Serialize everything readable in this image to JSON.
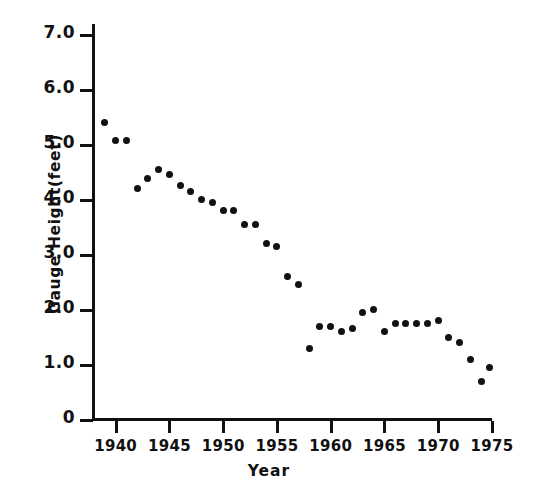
{
  "chart_data": {
    "type": "scatter",
    "title": "",
    "xlabel": "Year",
    "ylabel": "Gauge Height(feet)",
    "xlim": [
      1937.8,
      1975.0
    ],
    "ylim": [
      0,
      7.0
    ],
    "xticks": [
      1940,
      1945,
      1950,
      1955,
      1960,
      1965,
      1970,
      1975
    ],
    "xtick_labels": [
      "1940",
      "1945",
      "1950",
      "1955",
      "1960",
      "1965",
      "1970",
      "1975"
    ],
    "yticks": [
      0,
      1.0,
      2.0,
      3.0,
      4.0,
      5.0,
      6.0,
      7.0
    ],
    "ytick_labels": [
      "0",
      "1.0",
      "2.0",
      "3.0",
      "4.0",
      "5.0",
      "6.0",
      "7.0"
    ],
    "grid": false,
    "legend": false,
    "marker": "filled-circle",
    "marker_color": "#111111",
    "x": [
      1939,
      1940,
      1941,
      1942,
      1943,
      1944,
      1945,
      1946,
      1947,
      1948,
      1949,
      1950,
      1951,
      1952,
      1953,
      1954,
      1955,
      1956,
      1957,
      1958,
      1959,
      1960,
      1961,
      1962,
      1963,
      1964,
      1965,
      1966,
      1967,
      1968,
      1969,
      1970,
      1971,
      1972,
      1973,
      1974
    ],
    "values": [
      5.4,
      5.1,
      5.1,
      4.2,
      4.4,
      4.55,
      4.45,
      4.25,
      4.15,
      4.0,
      3.95,
      3.8,
      3.8,
      3.55,
      3.55,
      3.2,
      3.15,
      2.6,
      2.45,
      1.3,
      1.7,
      1.7,
      1.6,
      1.65,
      1.95,
      2.0,
      1.6,
      1.75,
      1.75,
      1.75,
      1.75,
      1.8,
      1.5,
      1.4,
      1.1,
      0.7
    ],
    "extra_points": [
      {
        "x": 1974.8,
        "y": 0.95
      }
    ],
    "points": [
      {
        "x": 1939.0,
        "y": 5.4
      },
      {
        "x": 1940.0,
        "y": 5.07
      },
      {
        "x": 1941.0,
        "y": 5.07
      },
      {
        "x": 1942.0,
        "y": 4.2
      },
      {
        "x": 1943.0,
        "y": 4.38
      },
      {
        "x": 1944.0,
        "y": 4.55
      },
      {
        "x": 1945.0,
        "y": 4.45
      },
      {
        "x": 1946.0,
        "y": 4.25
      },
      {
        "x": 1947.0,
        "y": 4.15
      },
      {
        "x": 1948.0,
        "y": 4.0
      },
      {
        "x": 1949.0,
        "y": 3.95
      },
      {
        "x": 1950.0,
        "y": 3.8
      },
      {
        "x": 1951.0,
        "y": 3.8
      },
      {
        "x": 1952.0,
        "y": 3.55
      },
      {
        "x": 1953.0,
        "y": 3.55
      },
      {
        "x": 1954.0,
        "y": 3.2
      },
      {
        "x": 1955.0,
        "y": 3.15
      },
      {
        "x": 1956.0,
        "y": 2.6
      },
      {
        "x": 1957.0,
        "y": 2.45
      },
      {
        "x": 1958.0,
        "y": 1.3
      },
      {
        "x": 1959.0,
        "y": 1.7
      },
      {
        "x": 1960.0,
        "y": 1.7
      },
      {
        "x": 1961.0,
        "y": 1.6
      },
      {
        "x": 1962.0,
        "y": 1.65
      },
      {
        "x": 1963.0,
        "y": 1.95
      },
      {
        "x": 1964.0,
        "y": 2.0
      },
      {
        "x": 1965.0,
        "y": 1.6
      },
      {
        "x": 1966.0,
        "y": 1.75
      },
      {
        "x": 1967.0,
        "y": 1.75
      },
      {
        "x": 1968.0,
        "y": 1.75
      },
      {
        "x": 1969.0,
        "y": 1.75
      },
      {
        "x": 1970.0,
        "y": 1.8
      },
      {
        "x": 1971.0,
        "y": 1.5
      },
      {
        "x": 1972.0,
        "y": 1.4
      },
      {
        "x": 1973.0,
        "y": 1.1
      },
      {
        "x": 1974.0,
        "y": 0.7
      },
      {
        "x": 1974.8,
        "y": 0.95
      }
    ]
  }
}
